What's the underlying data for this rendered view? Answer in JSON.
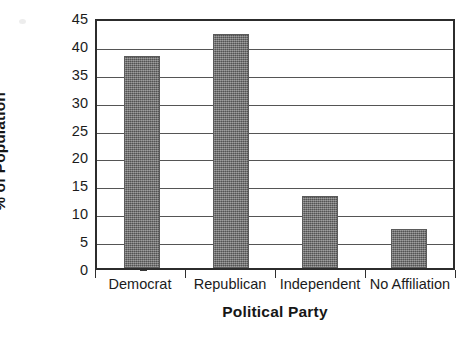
{
  "chart_data": {
    "type": "bar",
    "title": "",
    "xlabel": "Political Party",
    "ylabel": "% of Population",
    "categories": [
      "Democrat",
      "Republican",
      "Independent",
      "No Affiliation"
    ],
    "values": [
      38,
      42,
      13,
      7
    ],
    "ylim": [
      0,
      45
    ],
    "ytick_step": 5,
    "yticks": [
      45,
      40,
      35,
      30,
      25,
      20,
      15,
      10,
      5,
      0
    ],
    "ytick_labels": [
      "45",
      "40",
      "35",
      "30",
      "25",
      "20",
      "15",
      "10",
      "5",
      "0"
    ],
    "grid": "horizontal",
    "legend": "none",
    "orientation": "vertical",
    "bar_color": "#6e6e6e",
    "axis_color": "#2c2c2c",
    "gridline_color": "#555555",
    "background_color": "#ffffff",
    "series": [
      {
        "name": "% of Population",
        "values": [
          38,
          42,
          13,
          7
        ]
      }
    ]
  }
}
